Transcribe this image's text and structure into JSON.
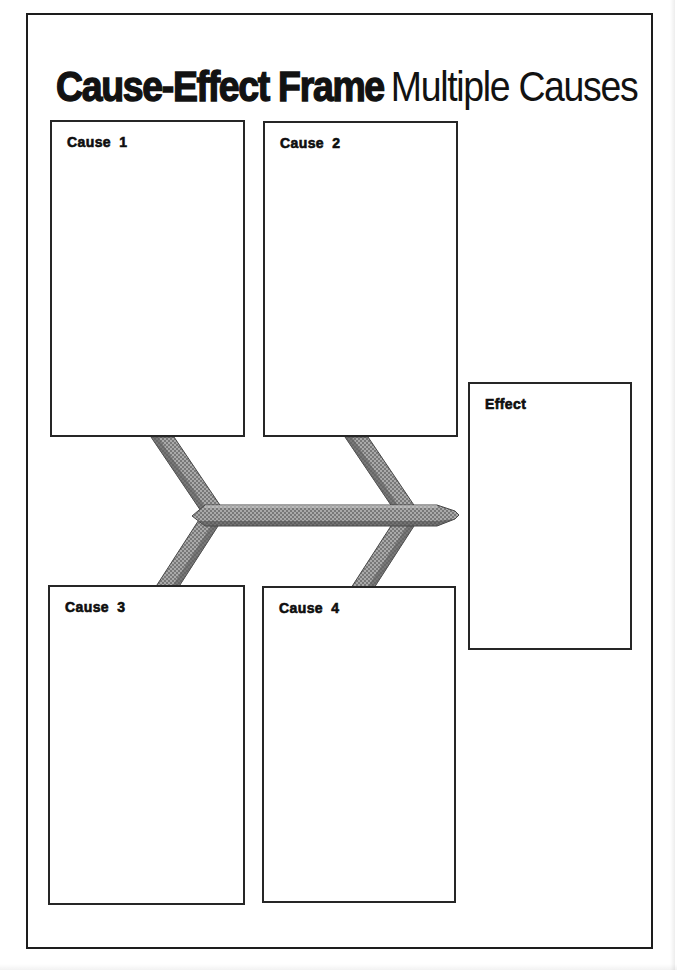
{
  "title": {
    "bold": "Cause-Effect Frame",
    "light": "Multiple Causes"
  },
  "boxes": {
    "cause1": {
      "label": "Cause 1"
    },
    "cause2": {
      "label": "Cause 2"
    },
    "cause3": {
      "label": "Cause 3"
    },
    "cause4": {
      "label": "Cause 4"
    },
    "effect": {
      "label": "Effect"
    }
  },
  "diagram": {
    "type": "fishbone-arrow",
    "arrow_fill": "#9a9a9a",
    "arrow_shadow": "#5e5e5e",
    "arrow_outline": "#474747",
    "border_color": "#1d1d1d"
  }
}
